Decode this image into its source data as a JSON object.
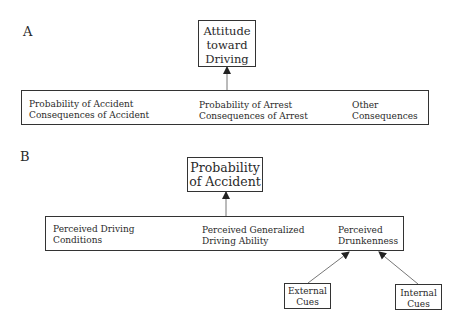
{
  "panel_a": {
    "label": "A",
    "top_box": [
      "Attitude",
      "toward",
      "Driving"
    ],
    "bar_items": [
      {
        "line1": "Probability of Accident",
        "line2": "Consequences of Accident"
      },
      {
        "line1": "Probability of Arrest",
        "line2": "Consequences of Arrest"
      },
      {
        "line1": "Other",
        "line2": "Consequences"
      }
    ]
  },
  "panel_b": {
    "label": "B",
    "top_box": [
      "Probability",
      "of Accident"
    ],
    "bar_items": [
      {
        "line1": "Perceived Driving",
        "line2": "Conditions"
      },
      {
        "line1": "Perceived Generalized",
        "line2": "Driving Ability"
      },
      {
        "line1": "Perceived",
        "line2": "Drunkenness"
      }
    ],
    "cue_boxes": [
      {
        "line1": "External",
        "line2": "Cues"
      },
      {
        "line1": "Internal",
        "line2": "Cues"
      }
    ]
  }
}
